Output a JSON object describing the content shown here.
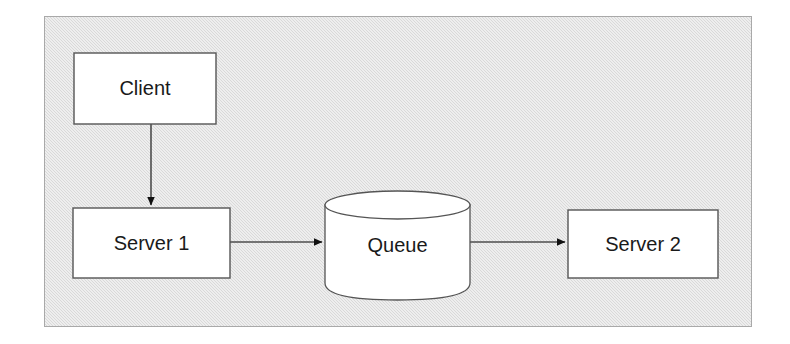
{
  "diagram": {
    "background_color": "#ffffff",
    "panel": {
      "fill": "#d9d9d9",
      "stroke": "#a9a9a9",
      "x": 44,
      "y": 16,
      "width": 708,
      "height": 311
    },
    "node_style": {
      "fill": "#ffffff",
      "stroke": "#555555",
      "text_color": "#1a1a1a",
      "font_size": 20
    },
    "edge_style": {
      "stroke": "#4d4d4d",
      "arrow_fill": "#111111"
    },
    "nodes": [
      {
        "id": "client",
        "label": "Client",
        "shape": "rectangle",
        "x": 74,
        "y": 53,
        "width": 142,
        "height": 71
      },
      {
        "id": "server1",
        "label": "Server 1",
        "shape": "rectangle",
        "x": 73,
        "y": 208,
        "width": 157,
        "height": 70
      },
      {
        "id": "queue",
        "label": "Queue",
        "shape": "cylinder",
        "x": 325,
        "y": 191,
        "width": 145,
        "height": 109
      },
      {
        "id": "server2",
        "label": "Server 2",
        "shape": "rectangle",
        "x": 568,
        "y": 210,
        "width": 150,
        "height": 68
      }
    ],
    "edges": [
      {
        "id": "client-to-server1",
        "from": "client",
        "to": "server1",
        "direction": "down",
        "label": "",
        "x1": 151,
        "y1": 124,
        "x2": 151,
        "y2": 207
      },
      {
        "id": "server1-to-queue",
        "from": "server1",
        "to": "queue",
        "direction": "right",
        "label": "",
        "x1": 230,
        "y1": 242,
        "x2": 324,
        "y2": 242
      },
      {
        "id": "queue-to-server2",
        "from": "queue",
        "to": "server2",
        "direction": "right",
        "label": "",
        "x1": 470,
        "y1": 242,
        "x2": 567,
        "y2": 242
      }
    ]
  }
}
